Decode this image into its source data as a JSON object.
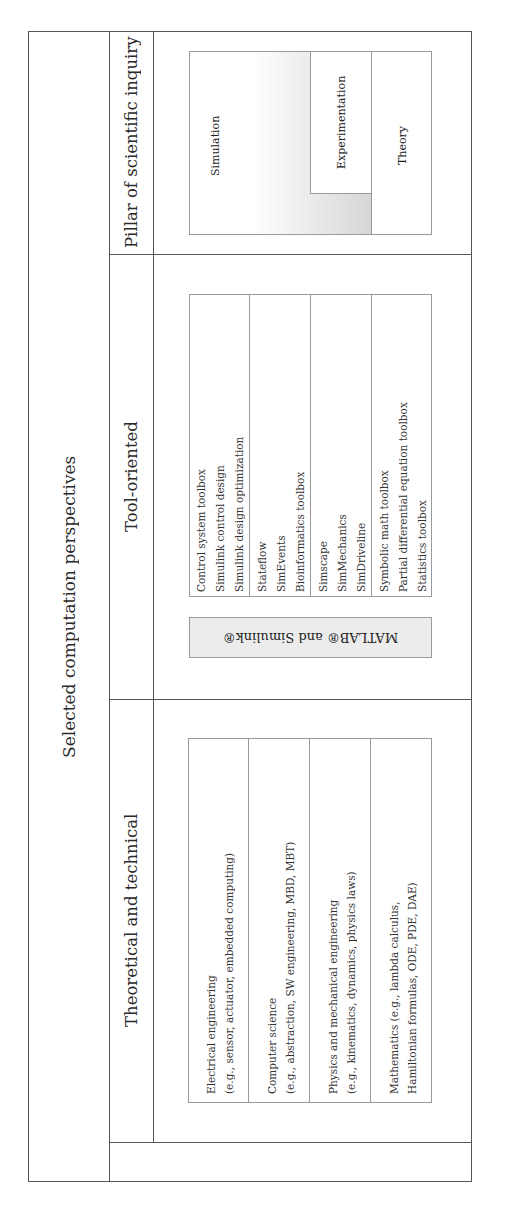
{
  "diagram": {
    "title": "Selected computation perspectives",
    "columns": [
      {
        "header": "Pillar of scientific inquiry",
        "pillars": {
          "simulation": "Simulation",
          "experimentation": "Experimentation",
          "theory": "Theory"
        }
      },
      {
        "header": "Tool-oriented",
        "platform_label": "MATLAB® and Simulink®",
        "tool_groups": [
          [
            "Control system toolbox",
            "Simulink control design",
            "Simulink design optimization"
          ],
          [
            "Stateflow",
            "SimEvents",
            "Bioinformatics toolbox"
          ],
          [
            "Simscape",
            "SimMechanics",
            "SimDriveline"
          ],
          [
            "Symbolic math toolbox",
            "Partial differential equation toolbox",
            "Statistics toolbox"
          ]
        ]
      },
      {
        "header": "Theoretical and technical",
        "disciplines": [
          [
            "Electrical engineering",
            "(e.g., sensor, actuator, embedded computing)"
          ],
          [
            "Computer science",
            "(e.g., abstraction, SW engineering, MBD, MBT)"
          ],
          [
            "Physics and mechanical engineering",
            "(e.g., kinematics, dynamics, physics laws)"
          ],
          [
            "Mathematics (e.g., lambda calculus,",
            "Hamiltonian formulas, ODE, PDE, DAE)"
          ]
        ]
      }
    ],
    "colors": {
      "frame": "#555555",
      "box_border": "#9a9a9a",
      "gradient_light": "#ffffff",
      "gradient_dark": "#d6d6d6",
      "platform_fill": "#ececec"
    }
  }
}
